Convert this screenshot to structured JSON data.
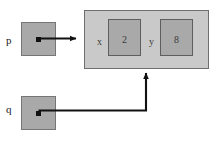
{
  "diagram": {
    "type": "pointer-struct-memory-diagram",
    "background_color": "#ffffff",
    "colors": {
      "pointer_box_fill": "#a9a9a9",
      "pointer_box_border": "#767676",
      "struct_fill": "#c9c9c9",
      "struct_border": "#6e6e6e",
      "field_fill": "#a9a9a9",
      "field_border": "#5e5e5e",
      "edge_color": "#111111",
      "text_color": "#1a1a1a"
    },
    "pointers": [
      {
        "id": "p",
        "label": "p",
        "target": "struct",
        "arrow_direction": "right"
      },
      {
        "id": "q",
        "label": "q",
        "target": "struct",
        "arrow_direction": "up"
      }
    ],
    "struct": {
      "name": "struct",
      "fields": [
        {
          "label": "x",
          "value": "2"
        },
        {
          "label": "y",
          "value": "8"
        }
      ]
    }
  }
}
